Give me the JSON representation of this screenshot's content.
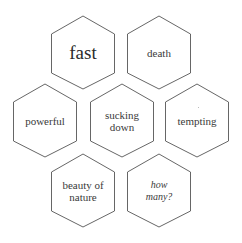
{
  "diagram": {
    "type": "hexagon-grid",
    "stroke_color": "#555555",
    "text_color": "#333333",
    "hexagons": [
      {
        "id": "fast",
        "label": "fast",
        "row": 1,
        "cx": 83,
        "top": 16,
        "style": "large"
      },
      {
        "id": "death",
        "label": "death",
        "row": 1,
        "cx": 159,
        "top": 16,
        "style": "normal"
      },
      {
        "id": "powerful",
        "label": "powerful",
        "row": 2,
        "cx": 45,
        "top": 84,
        "style": "normal"
      },
      {
        "id": "sucking-down",
        "label": "sucking\ndown",
        "row": 2,
        "cx": 122,
        "top": 84,
        "style": "normal"
      },
      {
        "id": "tempting",
        "label": "tempting",
        "row": 2,
        "cx": 197,
        "top": 84,
        "style": "normal"
      },
      {
        "id": "beauty-of-nature",
        "label": "beauty of\nnature",
        "row": 3,
        "cx": 83,
        "top": 154,
        "style": "normal"
      },
      {
        "id": "how-many",
        "label": "how\nmany?",
        "row": 3,
        "cx": 159,
        "top": 154,
        "style": "italic"
      }
    ]
  }
}
